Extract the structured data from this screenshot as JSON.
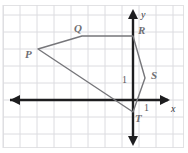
{
  "figure": {
    "background_color": "#ffffff",
    "frame_color": "#e2e2e4",
    "grid_color": "#dcdce0",
    "axis_color": "#1d1d1f",
    "polygon_color": "#76767a",
    "label_color": "#6f6f73",
    "grid_spacing_px": 17
  },
  "axes": {
    "x_label": "x",
    "y_label": "y",
    "origin_px": {
      "x": 133,
      "y": 100
    },
    "x_tick_label": "1",
    "y_tick_label": "1"
  },
  "polygon": {
    "name": "PQRST",
    "closed": true,
    "vertices": [
      {
        "label": "P",
        "px": {
          "x": 38,
          "y": 49
        },
        "coord": {
          "x": -5.6,
          "y": 3.0
        }
      },
      {
        "label": "Q",
        "px": {
          "x": 82,
          "y": 36
        },
        "coord": {
          "x": -3.0,
          "y": 3.8
        }
      },
      {
        "label": "R",
        "px": {
          "x": 133,
          "y": 36
        },
        "coord": {
          "x": 0,
          "y": 3.8
        }
      },
      {
        "label": "S",
        "px": {
          "x": 145,
          "y": 78
        },
        "coord": {
          "x": 0.7,
          "y": 1.3
        }
      },
      {
        "label": "T",
        "px": {
          "x": 133,
          "y": 112
        },
        "coord": {
          "x": 0,
          "y": -0.7
        }
      }
    ],
    "vertex_labels": [
      {
        "text": "P",
        "px": {
          "x": 25,
          "y": 52
        }
      },
      {
        "text": "Q",
        "px": {
          "x": 74,
          "y": 26
        }
      },
      {
        "text": "R",
        "px": {
          "x": 138,
          "y": 28
        }
      },
      {
        "text": "S",
        "px": {
          "x": 152,
          "y": 72
        }
      },
      {
        "text": "T",
        "px": {
          "x": 136,
          "y": 116
        }
      }
    ]
  }
}
